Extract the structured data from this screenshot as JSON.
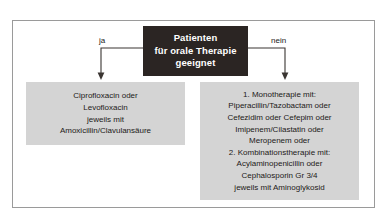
{
  "diagram": {
    "type": "decision-flowchart",
    "language": "de",
    "root": {
      "lines": [
        "Patienten",
        "für orale Therapie",
        "geeignet"
      ],
      "background_color": "#2b2523",
      "text_color": "#ffffff"
    },
    "branches": [
      {
        "edge_label": "ja",
        "side": "left",
        "box": {
          "background_color": "#d4d4d4",
          "lines": [
            "Ciprofloxacin oder",
            "Levofloxacin",
            "jeweils mit",
            "Amoxicillin/Clavulansäure"
          ]
        }
      },
      {
        "edge_label": "nein",
        "side": "right",
        "box": {
          "background_color": "#d4d4d4",
          "lines": [
            "1. Monotherapie mit:",
            "Piperacillin/Tazobactam oder",
            "Cefezidim oder Cefepim oder",
            "Imipenem/Cilastatin oder",
            "Meropenem oder",
            "2. Kombinationstherapie mit:",
            "Acylaminopenicillin oder",
            "Cephalosporin Gr 3/4",
            "jeweils mit Aminoglykosid"
          ]
        }
      }
    ],
    "frame": {
      "border_color": "#9a9a9a"
    },
    "connectors": {
      "line_color": "#3a3532"
    }
  }
}
